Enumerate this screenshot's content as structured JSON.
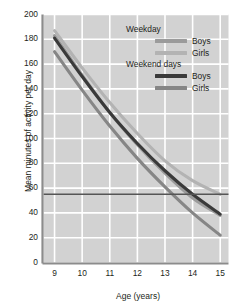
{
  "chart_data": {
    "type": "line",
    "title": "",
    "xlabel": "Age (years)",
    "ylabel": "Mean minutes of activity per day",
    "xlim": [
      8.6,
      15.3
    ],
    "ylim": [
      0,
      200
    ],
    "yticks": [
      0,
      20,
      40,
      60,
      80,
      100,
      120,
      140,
      160,
      180,
      200
    ],
    "xticks": [
      9,
      10,
      11,
      12,
      13,
      14,
      15
    ],
    "grid": true,
    "legend_position": "top-right",
    "x": [
      9,
      10,
      11,
      12,
      13,
      14,
      15
    ],
    "series": [
      {
        "name": "Weekday Boys",
        "group": "Weekday",
        "sex": "Boys",
        "color": "#9b9b9b",
        "values": [
          183,
          151,
          121,
          95,
          72,
          52,
          38
        ]
      },
      {
        "name": "Weekday Girls",
        "group": "Weekday",
        "sex": "Girls",
        "color": "#b3b3b3",
        "values": [
          187,
          157,
          129,
          104,
          82,
          66,
          55
        ]
      },
      {
        "name": "Weekend days Boys",
        "group": "Weekend days",
        "sex": "Boys",
        "color": "#3a3a3a",
        "values": [
          181,
          150,
          121,
          96,
          74,
          55,
          39
        ]
      },
      {
        "name": "Weekend days Girls",
        "group": "Weekend days",
        "sex": "Girls",
        "color": "#868686",
        "values": [
          170,
          139,
          110,
          84,
          61,
          40,
          22
        ]
      }
    ],
    "reference_line": {
      "name": "60 minutes guideline",
      "value": 55,
      "color": "#555555",
      "orientation": "horizontal"
    }
  },
  "legend": {
    "groups": [
      {
        "heading": "Weekday",
        "entries": [
          {
            "label": "Boys",
            "color": "#9b9b9b"
          },
          {
            "label": "Girls",
            "color": "#b3b3b3"
          }
        ]
      },
      {
        "heading": "Weekend days",
        "entries": [
          {
            "label": "Boys",
            "color": "#3a3a3a"
          },
          {
            "label": "Girls",
            "color": "#868686"
          }
        ]
      }
    ]
  },
  "theme": {
    "plot_background": "#d2d2d2",
    "gridline_color": "#ffffff",
    "axis_color": "#8c8c8c",
    "text_color": "#231f20",
    "page_background": "#ffffff"
  }
}
